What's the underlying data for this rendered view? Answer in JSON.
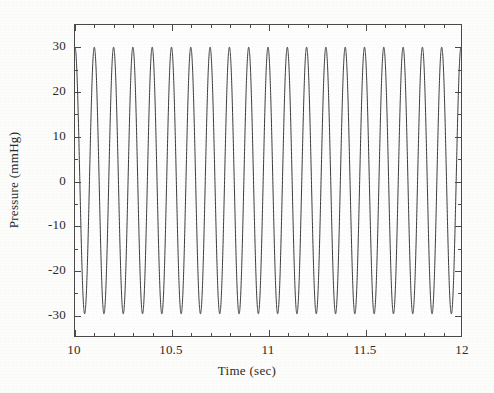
{
  "chart_data": {
    "type": "line",
    "title": "",
    "xlabel": "Time (sec)",
    "ylabel": "Pressure (mmHg)",
    "xlim": [
      10,
      12
    ],
    "ylim": [
      -35,
      35
    ],
    "xticks": [
      10,
      10.5,
      11,
      11.5,
      12
    ],
    "xtick_labels": [
      "10",
      "10.5",
      "11",
      "11.5",
      "12"
    ],
    "yticks": [
      30,
      20,
      10,
      0,
      -10,
      -20,
      -30
    ],
    "ytick_labels": [
      "30",
      "20",
      "10",
      "0",
      "-10",
      "-20",
      "-30"
    ],
    "grid": false,
    "legend": null,
    "line_color": "#3a3a3a",
    "line_width": 1.0,
    "series": [
      {
        "name": "Pressure waveform",
        "description": "Sinusoidal pressure oscillation",
        "waveform": "sinusoid",
        "frequency_hz": 10,
        "amplitude_mmHg": 30,
        "offset_mmHg": 0,
        "phase_rad": 1.5708,
        "cycles_visible": 20,
        "peak_value": 30,
        "trough_value": -30,
        "peak_to_peak": 60,
        "period_sec": 0.1,
        "samples_per_cycle": 200,
        "x_start": 10,
        "x_end": 12
      }
    ]
  },
  "axis": {
    "x_label_text": "Time (sec)",
    "y_label_text": "Pressure (mmHg)",
    "frame_color": "#4a4a4a",
    "tick_direction": "in"
  }
}
